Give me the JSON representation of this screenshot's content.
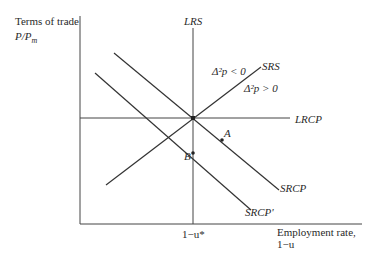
{
  "diagram": {
    "y_axis_label_line1": "Terms of trade",
    "y_axis_label_line2": "P/P",
    "y_axis_label_sub": "m",
    "x_axis_label_line1": "Employment rate,",
    "x_axis_label_line2": "1−u",
    "x_tick_label": "1−u*",
    "curves": {
      "lrs": "LRS",
      "srs": "SRS",
      "lrcp": "LRCP",
      "srcp": "SRCP",
      "srcp_prime": "SRCP'"
    },
    "region_labels": {
      "above": "Δ²p < 0",
      "below": "Δ²p > 0"
    },
    "points": {
      "a": "A",
      "b": "B"
    },
    "line_color": "#333333"
  }
}
